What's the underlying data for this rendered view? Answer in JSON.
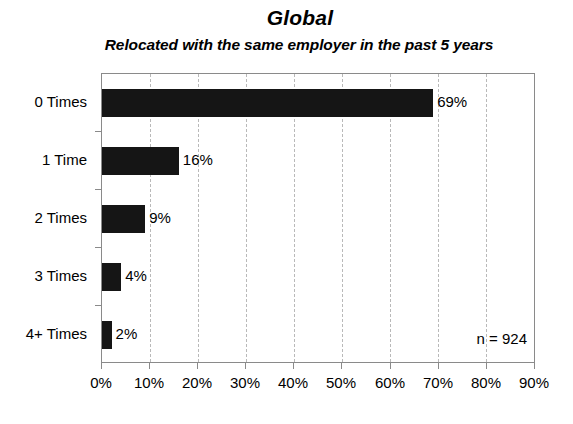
{
  "chart_data": {
    "type": "bar",
    "orientation": "horizontal",
    "title": "Global",
    "subtitle": "Relocated with the same employer in the past 5 years",
    "categories": [
      "0 Times",
      "1 Time",
      "2 Times",
      "3 Times",
      "4+ Times"
    ],
    "values": [
      69,
      16,
      9,
      4,
      2
    ],
    "value_labels": [
      "69%",
      "16%",
      "9%",
      "4%",
      "2%"
    ],
    "xlabel": "",
    "ylabel": "",
    "xlim": [
      0,
      90
    ],
    "xticks": [
      0,
      10,
      20,
      30,
      40,
      50,
      60,
      70,
      80,
      90
    ],
    "xtick_labels": [
      "0%",
      "10%",
      "20%",
      "30%",
      "40%",
      "50%",
      "60%",
      "70%",
      "80%",
      "90%"
    ],
    "grid": "vertical-dashed",
    "legend": "none",
    "annotation": "n = 924",
    "sample_size": 924,
    "bar_color": "#151515",
    "grid_color": "#b9b9b9",
    "axis_color": "#8a8a8a",
    "background_color": "#ffffff"
  }
}
